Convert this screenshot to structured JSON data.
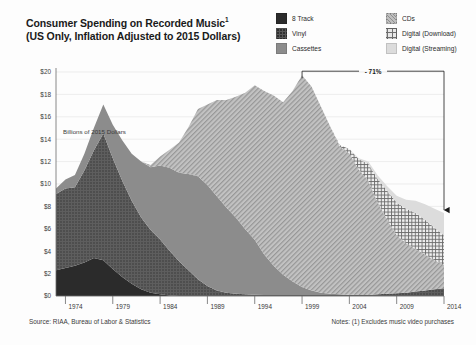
{
  "header": {
    "title_line1": "Consumer Spending on Recorded Music",
    "title_sup": "1",
    "title_line2": "(US Only, Inflation Adjusted to 2015 Dollars)"
  },
  "legend": {
    "column1": [
      {
        "label": "8 Track",
        "icon": "swatch-8track",
        "color": "#2b2b2b"
      },
      {
        "label": "Vinyl",
        "icon": "swatch-vinyl",
        "color": "#595959"
      },
      {
        "label": "Cassettes",
        "icon": "swatch-cassettes",
        "color": "#8c8c8c"
      }
    ],
    "column2": [
      {
        "label": "CDs",
        "icon": "swatch-cds",
        "color": "#bfbfbf"
      },
      {
        "label": "Digital (Download)",
        "icon": "swatch-download",
        "color": "#e8e8e8"
      },
      {
        "label": "Digital (Streaming)",
        "icon": "swatch-streaming",
        "color": "#dcdcdc"
      }
    ]
  },
  "footer": {
    "source": "Source: RIAA, Bureau of Labor & Statistics",
    "notes": "Notes: (1) Excludes music video purchases"
  },
  "chart_data": {
    "type": "area",
    "stacked": true,
    "xlabel": "",
    "ylabel": "Billions of 2015 Dollars",
    "ylim": [
      0,
      20
    ],
    "xlim": [
      1973,
      2014
    ],
    "ytick_labels": [
      "$0",
      "$2",
      "$4",
      "$6",
      "$8",
      "$10",
      "$12",
      "$14",
      "$16",
      "$18",
      "$20"
    ],
    "ytick_values": [
      0,
      2,
      4,
      6,
      8,
      10,
      12,
      14,
      16,
      18,
      20
    ],
    "xtick_labels": [
      "1974",
      "1979",
      "1984",
      "1989",
      "1994",
      "1999",
      "2004",
      "2009",
      "2014"
    ],
    "xtick_values": [
      1974,
      1979,
      1984,
      1989,
      1994,
      1999,
      2004,
      2009,
      2014
    ],
    "grid": "horizontal",
    "legend_position": "top-right",
    "x": [
      1973,
      1974,
      1975,
      1976,
      1977,
      1978,
      1979,
      1980,
      1981,
      1982,
      1983,
      1984,
      1985,
      1986,
      1987,
      1988,
      1989,
      1990,
      1991,
      1992,
      1993,
      1994,
      1995,
      1996,
      1997,
      1998,
      1999,
      2000,
      2001,
      2002,
      2003,
      2004,
      2005,
      2006,
      2007,
      2008,
      2009,
      2010,
      2011,
      2012,
      2013,
      2014
    ],
    "series": [
      {
        "name": "8 Track",
        "color": "#2b2b2b",
        "pattern": "solid",
        "values": [
          2.3,
          2.5,
          2.7,
          3.0,
          3.4,
          3.2,
          2.4,
          1.7,
          1.1,
          0.6,
          0.3,
          0.15,
          0.05,
          0,
          0,
          0,
          0,
          0,
          0,
          0,
          0,
          0,
          0,
          0,
          0,
          0,
          0,
          0,
          0,
          0,
          0,
          0,
          0,
          0,
          0,
          0,
          0,
          0,
          0,
          0,
          0,
          0
        ]
      },
      {
        "name": "Vinyl",
        "color": "#595959",
        "pattern": "dots",
        "values": [
          6.8,
          7.1,
          7.0,
          8.2,
          9.6,
          11.3,
          9.9,
          8.6,
          7.4,
          6.4,
          5.6,
          4.9,
          4.0,
          3.1,
          2.3,
          1.5,
          0.9,
          0.5,
          0.3,
          0.2,
          0.15,
          0.12,
          0.1,
          0.1,
          0.1,
          0.1,
          0.1,
          0.1,
          0.1,
          0.1,
          0.1,
          0.1,
          0.1,
          0.1,
          0.15,
          0.2,
          0.25,
          0.3,
          0.4,
          0.5,
          0.6,
          0.7
        ]
      },
      {
        "name": "Cassettes",
        "color": "#8c8c8c",
        "pattern": "solid",
        "values": [
          0.5,
          0.8,
          1.1,
          1.5,
          2.0,
          2.6,
          3.0,
          3.6,
          4.2,
          5.0,
          5.6,
          6.6,
          7.4,
          7.9,
          8.6,
          9.2,
          9.0,
          8.4,
          7.6,
          6.8,
          5.8,
          4.9,
          3.6,
          2.6,
          1.8,
          1.2,
          0.7,
          0.4,
          0.2,
          0.1,
          0.05,
          0.02,
          0,
          0,
          0,
          0,
          0,
          0,
          0,
          0,
          0,
          0
        ]
      },
      {
        "name": "CDs",
        "color": "#bfbfbf",
        "pattern": "diagonal",
        "values": [
          0,
          0,
          0,
          0,
          0,
          0,
          0,
          0,
          0,
          0,
          0.2,
          0.8,
          1.6,
          2.7,
          4.2,
          6.0,
          7.2,
          8.6,
          9.6,
          10.8,
          12.2,
          13.8,
          14.6,
          15.2,
          15.4,
          17.0,
          18.9,
          18.2,
          16.6,
          14.9,
          13.2,
          12.6,
          11.2,
          10.2,
          8.2,
          6.6,
          5.2,
          4.4,
          3.8,
          3.2,
          2.6,
          2.1
        ]
      },
      {
        "name": "Digital (Download)",
        "color": "#e8e8e8",
        "pattern": "crosshatch",
        "values": [
          0,
          0,
          0,
          0,
          0,
          0,
          0,
          0,
          0,
          0,
          0,
          0,
          0,
          0,
          0,
          0,
          0,
          0,
          0,
          0,
          0,
          0,
          0,
          0,
          0,
          0,
          0,
          0,
          0,
          0,
          0.1,
          0.4,
          0.9,
          1.5,
          2.1,
          2.6,
          2.9,
          3.1,
          3.2,
          3.1,
          2.9,
          2.6
        ]
      },
      {
        "name": "Digital (Streaming)",
        "color": "#dcdcdc",
        "pattern": "solid",
        "values": [
          0,
          0,
          0,
          0,
          0,
          0,
          0,
          0,
          0,
          0,
          0,
          0,
          0,
          0,
          0,
          0,
          0,
          0,
          0,
          0,
          0,
          0,
          0,
          0,
          0,
          0,
          0,
          0,
          0,
          0,
          0,
          0,
          0.1,
          0.2,
          0.3,
          0.4,
          0.6,
          0.8,
          1.1,
          1.4,
          1.7,
          2.0
        ]
      }
    ],
    "annotations": [
      {
        "label": "- 71%",
        "type": "bracket-arrow",
        "from_year": 1999,
        "to_year": 2014,
        "from_value": 19.0,
        "to_value": 7.4,
        "description": "Decline from 1999 peak to 2014"
      }
    ]
  }
}
